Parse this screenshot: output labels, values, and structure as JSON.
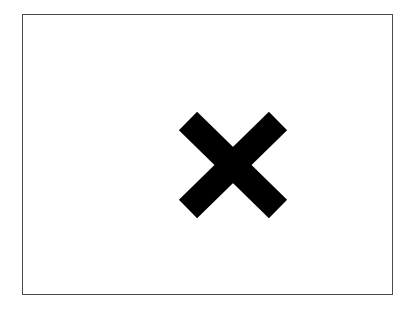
{
  "frame": {
    "border_color": "#4a4a4a",
    "background": "#ffffff"
  },
  "mark": {
    "icon": "close-x-icon",
    "color": "#000000"
  }
}
